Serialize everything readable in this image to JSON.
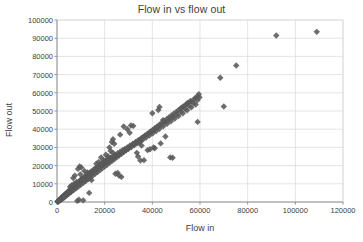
{
  "chart_data": {
    "type": "scatter",
    "title": "Flow in vs flow out",
    "xlabel": "Flow in",
    "ylabel": "Flow out",
    "xlim": [
      0,
      120000
    ],
    "ylim": [
      0,
      100000
    ],
    "xticks": [
      0,
      20000,
      40000,
      60000,
      80000,
      100000,
      120000
    ],
    "yticks": [
      0,
      10000,
      20000,
      30000,
      40000,
      50000,
      60000,
      70000,
      80000,
      90000,
      100000
    ],
    "xtick_labels": [
      "0",
      "20000",
      "40000",
      "60000",
      "80000",
      "100000",
      "120000"
    ],
    "ytick_labels": [
      "0",
      "10000",
      "20000",
      "30000",
      "40000",
      "50000",
      "60000",
      "70000",
      "80000",
      "90000",
      "100000"
    ],
    "grid": true,
    "grid_axes": "both",
    "legend": false,
    "marker": "diamond",
    "marker_color": "#595959",
    "marker_size": 3.2,
    "grid_color": "#d9d9d9",
    "axis_color": "#868686",
    "text_color": "#404040",
    "background": "#ffffff",
    "series": [
      {
        "name": "Flow in vs flow out",
        "points": [
          [
            200,
            150
          ],
          [
            350,
            400
          ],
          [
            500,
            300
          ],
          [
            620,
            700
          ],
          [
            750,
            500
          ],
          [
            900,
            1100
          ],
          [
            1000,
            800
          ],
          [
            1150,
            1400
          ],
          [
            1250,
            900
          ],
          [
            1400,
            1700
          ],
          [
            1500,
            1200
          ],
          [
            1600,
            2000
          ],
          [
            1750,
            1500
          ],
          [
            1850,
            2300
          ],
          [
            1950,
            1800
          ],
          [
            2100,
            2600
          ],
          [
            2200,
            1900
          ],
          [
            2350,
            2900
          ],
          [
            2450,
            2200
          ],
          [
            2600,
            3200
          ],
          [
            2700,
            2500
          ],
          [
            2850,
            3500
          ],
          [
            2950,
            2700
          ],
          [
            3100,
            3800
          ],
          [
            3200,
            3000
          ],
          [
            3350,
            4100
          ],
          [
            3450,
            3300
          ],
          [
            3600,
            4400
          ],
          [
            3700,
            3600
          ],
          [
            3850,
            4700
          ],
          [
            3950,
            3900
          ],
          [
            4100,
            5000
          ],
          [
            4200,
            4200
          ],
          [
            4350,
            5300
          ],
          [
            4450,
            4500
          ],
          [
            4600,
            5600
          ],
          [
            4700,
            4800
          ],
          [
            4850,
            5900
          ],
          [
            4950,
            5100
          ],
          [
            5100,
            6200
          ],
          [
            5200,
            5400
          ],
          [
            5350,
            6500
          ],
          [
            5450,
            5700
          ],
          [
            5600,
            6800
          ],
          [
            5700,
            6000
          ],
          [
            5850,
            7100
          ],
          [
            5950,
            6300
          ],
          [
            6100,
            7400
          ],
          [
            6200,
            6600
          ],
          [
            6350,
            7700
          ],
          [
            6450,
            6900
          ],
          [
            6600,
            8000
          ],
          [
            6700,
            7200
          ],
          [
            6850,
            8300
          ],
          [
            6950,
            7500
          ],
          [
            7100,
            8600
          ],
          [
            7200,
            7800
          ],
          [
            7350,
            8900
          ],
          [
            7450,
            8100
          ],
          [
            7600,
            9200
          ],
          [
            7700,
            8400
          ],
          [
            7850,
            9500
          ],
          [
            7950,
            8700
          ],
          [
            8100,
            9800
          ],
          [
            8200,
            9000
          ],
          [
            8350,
            10100
          ],
          [
            8450,
            9300
          ],
          [
            8600,
            10400
          ],
          [
            8700,
            9600
          ],
          [
            8850,
            10700
          ],
          [
            8950,
            9900
          ],
          [
            9100,
            11000
          ],
          [
            9200,
            10200
          ],
          [
            9350,
            11300
          ],
          [
            9450,
            10500
          ],
          [
            9600,
            11600
          ],
          [
            9700,
            10800
          ],
          [
            9850,
            11900
          ],
          [
            9950,
            11100
          ],
          [
            10100,
            12200
          ],
          [
            10200,
            11400
          ],
          [
            10400,
            12600
          ],
          [
            10600,
            11800
          ],
          [
            10800,
            13000
          ],
          [
            11000,
            12200
          ],
          [
            11200,
            13400
          ],
          [
            11400,
            12600
          ],
          [
            11600,
            13800
          ],
          [
            11800,
            13000
          ],
          [
            12000,
            14200
          ],
          [
            12200,
            13400
          ],
          [
            12500,
            14800
          ],
          [
            12800,
            14000
          ],
          [
            13100,
            15400
          ],
          [
            13400,
            14600
          ],
          [
            13700,
            16000
          ],
          [
            14000,
            15200
          ],
          [
            14300,
            16600
          ],
          [
            14600,
            15800
          ],
          [
            14900,
            17200
          ],
          [
            15200,
            16400
          ],
          [
            15600,
            18000
          ],
          [
            16000,
            17200
          ],
          [
            16400,
            18800
          ],
          [
            16800,
            18000
          ],
          [
            17200,
            19600
          ],
          [
            17600,
            18800
          ],
          [
            18000,
            20400
          ],
          [
            18400,
            19600
          ],
          [
            18800,
            21200
          ],
          [
            19200,
            20400
          ],
          [
            19600,
            22000
          ],
          [
            20000,
            21200
          ],
          [
            20500,
            22800
          ],
          [
            21000,
            22000
          ],
          [
            21500,
            23600
          ],
          [
            22000,
            22800
          ],
          [
            22500,
            24400
          ],
          [
            23000,
            23600
          ],
          [
            23500,
            25200
          ],
          [
            24000,
            24400
          ],
          [
            24500,
            26000
          ],
          [
            25000,
            25200
          ],
          [
            25500,
            26800
          ],
          [
            26000,
            26000
          ],
          [
            26500,
            27600
          ],
          [
            27000,
            26800
          ],
          [
            27500,
            28400
          ],
          [
            28000,
            27600
          ],
          [
            28500,
            29200
          ],
          [
            29000,
            28400
          ],
          [
            29500,
            30000
          ],
          [
            30000,
            29200
          ],
          [
            30600,
            31000
          ],
          [
            31200,
            30200
          ],
          [
            31800,
            32000
          ],
          [
            32400,
            31200
          ],
          [
            33000,
            33000
          ],
          [
            33600,
            32200
          ],
          [
            34200,
            34000
          ],
          [
            34800,
            33200
          ],
          [
            35400,
            35000
          ],
          [
            36000,
            34200
          ],
          [
            36700,
            36200
          ],
          [
            37400,
            35400
          ],
          [
            38100,
            37400
          ],
          [
            38800,
            36600
          ],
          [
            39500,
            38600
          ],
          [
            40200,
            37800
          ],
          [
            40900,
            39800
          ],
          [
            41600,
            39000
          ],
          [
            42300,
            41000
          ],
          [
            43000,
            40200
          ],
          [
            43800,
            42400
          ],
          [
            44600,
            41600
          ],
          [
            45400,
            43800
          ],
          [
            46200,
            43000
          ],
          [
            47000,
            45200
          ],
          [
            47800,
            44400
          ],
          [
            48600,
            46600
          ],
          [
            49400,
            45800
          ],
          [
            50200,
            48000
          ],
          [
            51000,
            47200
          ],
          [
            51900,
            49600
          ],
          [
            52800,
            48800
          ],
          [
            53700,
            51200
          ],
          [
            54600,
            50400
          ],
          [
            55500,
            52800
          ],
          [
            56400,
            52000
          ],
          [
            57300,
            54400
          ],
          [
            58200,
            53600
          ],
          [
            59000,
            56000
          ],
          [
            59800,
            57500
          ],
          [
            59500,
            59200
          ],
          [
            58800,
            58000
          ],
          [
            57800,
            56800
          ],
          [
            56000,
            55500
          ],
          [
            55000,
            54500
          ],
          [
            54000,
            53500
          ],
          [
            53000,
            52500
          ],
          [
            52000,
            51500
          ],
          [
            51000,
            50500
          ],
          [
            50000,
            49500
          ],
          [
            49000,
            48500
          ],
          [
            48000,
            47500
          ],
          [
            47000,
            46500
          ],
          [
            46000,
            45500
          ],
          [
            45000,
            44500
          ],
          [
            44000,
            43500
          ],
          [
            43000,
            42500
          ],
          [
            42000,
            41500
          ],
          [
            41000,
            40500
          ],
          [
            40000,
            39500
          ],
          [
            39000,
            38500
          ],
          [
            38000,
            37500
          ],
          [
            37000,
            36500
          ],
          [
            36000,
            35500
          ],
          [
            35000,
            34500
          ],
          [
            34000,
            33500
          ],
          [
            33000,
            32500
          ],
          [
            32000,
            31500
          ],
          [
            31000,
            30500
          ],
          [
            30000,
            29500
          ],
          [
            29000,
            28500
          ],
          [
            28000,
            27500
          ],
          [
            27000,
            26500
          ],
          [
            26000,
            25500
          ],
          [
            25000,
            24500
          ],
          [
            24000,
            23500
          ],
          [
            23000,
            22500
          ],
          [
            22000,
            21500
          ],
          [
            21000,
            20500
          ],
          [
            20000,
            19500
          ],
          [
            19000,
            18500
          ],
          [
            18000,
            17500
          ],
          [
            17000,
            16500
          ],
          [
            16000,
            15500
          ],
          [
            15000,
            14500
          ],
          [
            14000,
            13500
          ],
          [
            13000,
            12500
          ],
          [
            12000,
            11500
          ],
          [
            11000,
            10500
          ],
          [
            10000,
            9500
          ],
          [
            9000,
            8500
          ],
          [
            8000,
            7500
          ],
          [
            7000,
            6500
          ],
          [
            6000,
            5500
          ],
          [
            5000,
            4500
          ],
          [
            4000,
            3500
          ],
          [
            3000,
            2500
          ],
          [
            2000,
            1500
          ],
          [
            1000,
            800
          ],
          [
            500,
            350
          ],
          [
            9500,
            19500
          ],
          [
            10200,
            19000
          ],
          [
            8800,
            18200
          ],
          [
            11500,
            17000
          ],
          [
            12800,
            16200
          ],
          [
            9800,
            15200
          ],
          [
            7500,
            14500
          ],
          [
            6800,
            13200
          ],
          [
            10500,
            12500
          ],
          [
            11800,
            11500
          ],
          [
            13200,
            13000
          ],
          [
            14500,
            12000
          ],
          [
            8200,
            11000
          ],
          [
            7200,
            10000
          ],
          [
            6200,
            9200
          ],
          [
            5500,
            8400
          ],
          [
            13500,
            5000
          ],
          [
            11000,
            900
          ],
          [
            9200,
            1200
          ],
          [
            8500,
            600
          ],
          [
            17500,
            22000
          ],
          [
            18500,
            24500
          ],
          [
            19500,
            23000
          ],
          [
            20500,
            26000
          ],
          [
            21500,
            25000
          ],
          [
            22500,
            28000
          ],
          [
            23500,
            27000
          ],
          [
            16500,
            21000
          ],
          [
            23000,
            33000
          ],
          [
            23500,
            34500
          ],
          [
            24000,
            32000
          ],
          [
            22000,
            30000
          ],
          [
            26500,
            37000
          ],
          [
            28000,
            41500
          ],
          [
            29500,
            40000
          ],
          [
            31000,
            42000
          ],
          [
            32000,
            41800
          ],
          [
            30500,
            38000
          ],
          [
            27000,
            13800
          ],
          [
            24500,
            15500
          ],
          [
            25500,
            16000
          ],
          [
            26000,
            14500
          ],
          [
            34500,
            32500
          ],
          [
            35500,
            31000
          ],
          [
            33500,
            27000
          ],
          [
            34000,
            25000
          ],
          [
            35000,
            22800
          ],
          [
            36500,
            23000
          ],
          [
            38000,
            28500
          ],
          [
            39000,
            29000
          ],
          [
            40500,
            30000
          ],
          [
            41000,
            29500
          ],
          [
            40000,
            48800
          ],
          [
            43000,
            52200
          ],
          [
            42500,
            50500
          ],
          [
            43500,
            32200
          ],
          [
            45500,
            36000
          ],
          [
            47500,
            24500
          ],
          [
            48500,
            24300
          ],
          [
            44500,
            45000
          ],
          [
            59000,
            44000
          ],
          [
            70000,
            52500
          ],
          [
            68500,
            68300
          ],
          [
            75200,
            75000
          ],
          [
            92000,
            91500
          ],
          [
            109000,
            93500
          ],
          [
            54500,
            54000
          ],
          [
            56500,
            55200
          ],
          [
            58000,
            57000
          ],
          [
            52500,
            52000
          ]
        ]
      }
    ]
  }
}
